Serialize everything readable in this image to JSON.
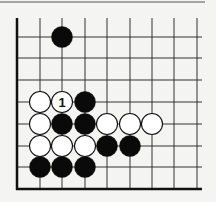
{
  "diagram": {
    "type": "go-board-fragment",
    "colors": {
      "background": "#f4f4f2",
      "line": "#333333",
      "edge": "#111111",
      "black": "#0a0a0a",
      "white": "#ffffff"
    },
    "grid": {
      "columns_x": [
        17,
        40,
        62,
        85,
        107,
        130,
        152,
        174,
        197
      ],
      "rows_y": [
        37,
        58,
        80,
        102,
        124,
        146,
        167,
        189
      ],
      "line_right_end": 202,
      "line_top_start": 18,
      "left_edge": true,
      "bottom_edge": true
    },
    "top_rule": {
      "y": 2,
      "x1": 0,
      "x2": 205
    },
    "stone_radius": 10.5,
    "stones": [
      {
        "color": "black",
        "col": 2,
        "row": 0
      },
      {
        "color": "white",
        "col": 1,
        "row": 3
      },
      {
        "color": "white",
        "col": 2,
        "row": 3,
        "label": "1"
      },
      {
        "color": "black",
        "col": 3,
        "row": 3
      },
      {
        "color": "white",
        "col": 1,
        "row": 4
      },
      {
        "color": "black",
        "col": 2,
        "row": 4
      },
      {
        "color": "black",
        "col": 3,
        "row": 4
      },
      {
        "color": "white",
        "col": 4,
        "row": 4
      },
      {
        "color": "white",
        "col": 5,
        "row": 4
      },
      {
        "color": "white",
        "col": 6,
        "row": 4
      },
      {
        "color": "white",
        "col": 1,
        "row": 5
      },
      {
        "color": "white",
        "col": 2,
        "row": 5
      },
      {
        "color": "white",
        "col": 3,
        "row": 5
      },
      {
        "color": "black",
        "col": 4,
        "row": 5
      },
      {
        "color": "black",
        "col": 5,
        "row": 5
      },
      {
        "color": "black",
        "col": 1,
        "row": 6
      },
      {
        "color": "black",
        "col": 2,
        "row": 6
      },
      {
        "color": "black",
        "col": 3,
        "row": 6
      }
    ]
  }
}
